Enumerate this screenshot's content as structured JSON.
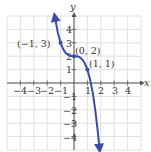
{
  "chart_data": {
    "type": "line",
    "title": "",
    "xlabel": "x",
    "ylabel": "y",
    "xlim": [
      -5,
      5
    ],
    "ylim": [
      -5,
      5
    ],
    "grid": true,
    "x_ticks": [
      -4,
      -3,
      -2,
      -1,
      1,
      2,
      3,
      4
    ],
    "y_ticks": [
      4,
      3,
      2,
      1,
      -1,
      -2,
      -3,
      -4
    ],
    "x_tick_labels": [
      "−4",
      "−3",
      "−2",
      "−1",
      "1",
      "2",
      "3",
      "4"
    ],
    "y_tick_labels": [
      "4",
      "3",
      "2",
      "1",
      "−1",
      "−2",
      "−3",
      "−4"
    ],
    "series": [
      {
        "name": "y = -x^3 + 2",
        "color": "#3d4da6",
        "x": [
          -1.44,
          -1.2,
          -1.0,
          -0.8,
          -0.6,
          -0.4,
          -0.2,
          0,
          0.2,
          0.4,
          0.6,
          0.8,
          1.0,
          1.2,
          1.4,
          1.6,
          1.8,
          1.91
        ],
        "y": [
          5.0,
          3.73,
          3.0,
          2.51,
          2.22,
          2.06,
          2.01,
          2.0,
          1.99,
          1.94,
          1.78,
          1.49,
          1.0,
          0.27,
          -0.74,
          -2.1,
          -3.83,
          -4.97
        ],
        "arrows": "both"
      }
    ],
    "points": [
      {
        "x": -1,
        "y": 3,
        "label": "(−1, 3)"
      },
      {
        "x": 0,
        "y": 2,
        "label": "(0, 2)"
      },
      {
        "x": 1,
        "y": 1,
        "label": "(1, 1)"
      }
    ],
    "colors": {
      "curve": "#3d4da6",
      "grid": "#d9d9d9",
      "axis": "#555555"
    }
  },
  "labels": {
    "x_axis": "x",
    "y_axis": "y",
    "p1": "(−1, 3)",
    "p2": "(0, 2)",
    "p3": "(1, 1)",
    "xt": [
      "−4",
      "−3",
      "−2",
      "−1",
      "1",
      "2",
      "3",
      "4"
    ],
    "yt": [
      "4",
      "3",
      "2",
      "1",
      "−1",
      "−2",
      "−3",
      "−4"
    ]
  }
}
